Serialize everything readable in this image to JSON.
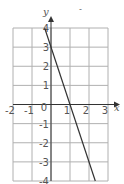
{
  "chart_data": {
    "type": "line",
    "title": "",
    "xlabel": "x",
    "ylabel": "y",
    "xlim": [
      -2,
      3
    ],
    "ylim": [
      -4,
      4
    ],
    "grid": true,
    "x_ticks": [
      "-2",
      "-1",
      "0",
      "1",
      "2",
      "3"
    ],
    "y_ticks": [
      "4",
      "3",
      "2",
      "1",
      "-1",
      "-2",
      "-3",
      "-4"
    ],
    "series": [
      {
        "name": "line",
        "equation": "y = 3 - 3x",
        "x": [
          -0.333,
          2.333
        ],
        "y": [
          4,
          -4
        ]
      }
    ],
    "colors": {
      "grid": "#b0b0b0",
      "axis": "#333333",
      "line": "#333333"
    }
  }
}
